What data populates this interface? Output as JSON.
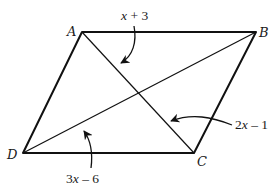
{
  "figure": {
    "type": "parallelogram",
    "vertices": {
      "A": {
        "label": "A",
        "x": 82,
        "y": 32
      },
      "B": {
        "label": "B",
        "x": 256,
        "y": 32
      },
      "C": {
        "label": "C",
        "x": 194,
        "y": 153
      },
      "D": {
        "label": "D",
        "x": 23,
        "y": 153
      }
    },
    "sides": [
      "AB",
      "BC",
      "CD",
      "DA"
    ],
    "diagonals": [
      "AC",
      "BD"
    ],
    "diagonal_intersection": {
      "x": 139,
      "y": 92
    },
    "segment_labels": [
      {
        "id": "AE",
        "expression": {
          "coef": "",
          "var": "x",
          "op": " + ",
          "const": "3"
        }
      },
      {
        "id": "EC",
        "expression": {
          "coef": "2",
          "var": "x",
          "op": " – ",
          "const": "1"
        }
      },
      {
        "id": "DE",
        "expression": {
          "coef": "3",
          "var": "x",
          "op": " – ",
          "const": "6"
        }
      }
    ]
  }
}
